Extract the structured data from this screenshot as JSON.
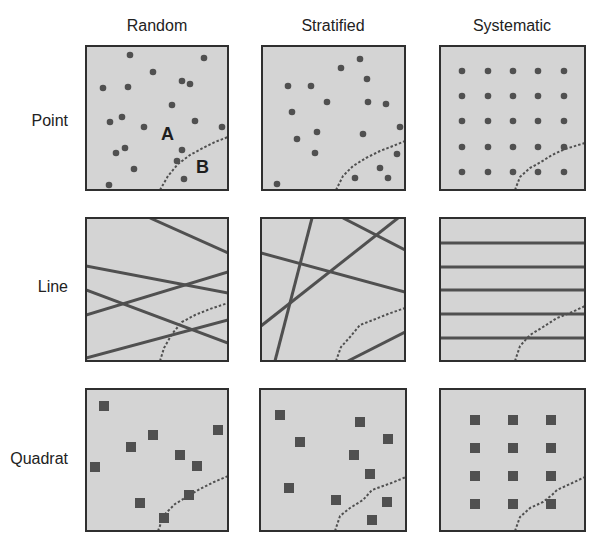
{
  "figure": {
    "columns": [
      "Random",
      "Stratified",
      "Systematic"
    ],
    "rows": [
      "Point",
      "Line",
      "Quadrat"
    ],
    "colors": {
      "panel_fill": "#d4d4d4",
      "panel_border": "#2f2f2f",
      "mark": "#505050",
      "boundary": "#505050",
      "text": "#222222"
    },
    "region_labels": [
      {
        "text": "A",
        "x": 161,
        "y": 140
      },
      {
        "text": "B",
        "x": 196,
        "y": 173
      }
    ]
  },
  "panels": [
    {
      "name": "panel-random-point",
      "row": "Point",
      "column": "Random",
      "box": [
        86,
        46,
        142,
        144
      ],
      "type": "points",
      "boundary": [
        [
          160,
          190
        ],
        [
          168,
          176
        ],
        [
          178,
          164
        ],
        [
          190,
          155
        ],
        [
          203,
          148
        ],
        [
          215,
          142
        ],
        [
          228,
          137
        ]
      ],
      "points": [
        [
          130,
          55
        ],
        [
          204,
          58
        ],
        [
          153,
          72
        ],
        [
          182,
          81
        ],
        [
          190,
          84
        ],
        [
          103,
          88
        ],
        [
          128,
          87
        ],
        [
          172,
          105
        ],
        [
          110,
          122
        ],
        [
          122,
          117
        ],
        [
          144,
          127
        ],
        [
          195,
          121
        ],
        [
          222,
          127
        ],
        [
          116,
          153
        ],
        [
          125,
          148
        ],
        [
          182,
          150
        ],
        [
          177,
          161
        ],
        [
          134,
          169
        ],
        [
          184,
          179
        ],
        [
          109,
          185
        ]
      ]
    },
    {
      "name": "panel-stratified-point",
      "row": "Point",
      "column": "Stratified",
      "box": [
        262,
        46,
        143,
        144
      ],
      "type": "points",
      "boundary": [
        [
          336,
          190
        ],
        [
          343,
          176
        ],
        [
          353,
          166
        ],
        [
          366,
          158
        ],
        [
          380,
          151
        ],
        [
          393,
          146
        ],
        [
          405,
          141
        ]
      ],
      "points": [
        [
          360,
          59
        ],
        [
          341,
          68
        ],
        [
          288,
          86
        ],
        [
          311,
          86
        ],
        [
          367,
          79
        ],
        [
          327,
          102
        ],
        [
          292,
          112
        ],
        [
          368,
          102
        ],
        [
          386,
          104
        ],
        [
          317,
          132
        ],
        [
          363,
          134
        ],
        [
          297,
          139
        ],
        [
          315,
          153
        ],
        [
          380,
          168
        ],
        [
          355,
          178
        ],
        [
          388,
          178
        ],
        [
          400,
          127
        ],
        [
          397,
          154
        ],
        [
          277,
          184
        ]
      ]
    },
    {
      "name": "panel-systematic-point",
      "row": "Point",
      "column": "Systematic",
      "box": [
        440,
        46,
        145,
        144
      ],
      "type": "points",
      "boundary": [
        [
          515,
          190
        ],
        [
          520,
          177
        ],
        [
          530,
          168
        ],
        [
          541,
          162
        ],
        [
          552,
          155
        ],
        [
          565,
          149
        ],
        [
          585,
          143
        ]
      ],
      "points": [
        [
          462,
          71
        ],
        [
          488,
          71
        ],
        [
          513,
          71
        ],
        [
          538,
          71
        ],
        [
          564,
          71
        ],
        [
          462,
          96
        ],
        [
          488,
          96
        ],
        [
          513,
          96
        ],
        [
          538,
          96
        ],
        [
          564,
          96
        ],
        [
          462,
          121
        ],
        [
          488,
          121
        ],
        [
          513,
          121
        ],
        [
          538,
          121
        ],
        [
          564,
          121
        ],
        [
          462,
          147
        ],
        [
          488,
          147
        ],
        [
          513,
          147
        ],
        [
          538,
          147
        ],
        [
          564,
          147
        ],
        [
          462,
          172
        ],
        [
          488,
          172
        ],
        [
          513,
          172
        ],
        [
          538,
          172
        ],
        [
          564,
          172
        ]
      ]
    },
    {
      "name": "panel-random-line",
      "row": "Line",
      "column": "Random",
      "box": [
        86,
        218,
        142,
        143
      ],
      "type": "lines",
      "boundary": [
        [
          160,
          361
        ],
        [
          164,
          348
        ],
        [
          172,
          334
        ],
        [
          182,
          322
        ],
        [
          195,
          315
        ],
        [
          210,
          309
        ],
        [
          228,
          303
        ]
      ],
      "lines": [
        [
          [
            150,
            218
          ],
          [
            228,
            253
          ]
        ],
        [
          [
            86,
            266
          ],
          [
            228,
            293
          ]
        ],
        [
          [
            86,
            315
          ],
          [
            228,
            272
          ]
        ],
        [
          [
            86,
            290
          ],
          [
            228,
            343
          ]
        ],
        [
          [
            86,
            358
          ],
          [
            228,
            320
          ]
        ]
      ]
    },
    {
      "name": "panel-stratified-line",
      "row": "Line",
      "column": "Stratified",
      "box": [
        261,
        218,
        144,
        143
      ],
      "type": "lines",
      "boundary": [
        [
          336,
          361
        ],
        [
          341,
          347
        ],
        [
          350,
          337
        ],
        [
          360,
          325
        ],
        [
          373,
          320
        ],
        [
          388,
          314
        ],
        [
          405,
          308
        ]
      ],
      "lines": [
        [
          [
            312,
            218
          ],
          [
            275,
            361
          ]
        ],
        [
          [
            343,
            218
          ],
          [
            405,
            250
          ]
        ],
        [
          [
            261,
            253
          ],
          [
            405,
            292
          ]
        ],
        [
          [
            261,
            326
          ],
          [
            398,
            218
          ]
        ],
        [
          [
            348,
            361
          ],
          [
            405,
            332
          ]
        ]
      ]
    },
    {
      "name": "panel-systematic-line",
      "row": "Line",
      "column": "Systematic",
      "box": [
        440,
        218,
        145,
        143
      ],
      "type": "lines",
      "boundary": [
        [
          515,
          361
        ],
        [
          520,
          346
        ],
        [
          530,
          335
        ],
        [
          543,
          327
        ],
        [
          557,
          318
        ],
        [
          570,
          313
        ],
        [
          585,
          306
        ]
      ],
      "lines": [
        [
          [
            440,
            243
          ],
          [
            585,
            243
          ]
        ],
        [
          [
            440,
            267
          ],
          [
            585,
            267
          ]
        ],
        [
          [
            440,
            290
          ],
          [
            585,
            290
          ]
        ],
        [
          [
            440,
            314
          ],
          [
            585,
            314
          ]
        ],
        [
          [
            440,
            338
          ],
          [
            585,
            338
          ]
        ]
      ]
    },
    {
      "name": "panel-random-quadrat",
      "row": "Quadrat",
      "column": "Random",
      "box": [
        86,
        389,
        142,
        142
      ],
      "type": "quadrats",
      "quadrat_size": 10,
      "boundary": [
        [
          158,
          531
        ],
        [
          164,
          515
        ],
        [
          175,
          504
        ],
        [
          190,
          495
        ],
        [
          200,
          489
        ],
        [
          214,
          482
        ],
        [
          228,
          476
        ]
      ],
      "quadrats": [
        [
          104,
          406
        ],
        [
          153,
          435
        ],
        [
          131,
          447
        ],
        [
          218,
          430
        ],
        [
          95,
          467
        ],
        [
          180,
          455
        ],
        [
          197,
          466
        ],
        [
          189,
          495
        ],
        [
          140,
          503
        ],
        [
          164,
          518
        ]
      ]
    },
    {
      "name": "panel-stratified-quadrat",
      "row": "Quadrat",
      "column": "Stratified",
      "box": [
        260,
        389,
        146,
        142
      ],
      "type": "quadrats",
      "quadrat_size": 10,
      "boundary": [
        [
          335,
          531
        ],
        [
          340,
          516
        ],
        [
          350,
          508
        ],
        [
          363,
          500
        ],
        [
          372,
          490
        ],
        [
          383,
          486
        ],
        [
          394,
          482
        ],
        [
          406,
          477
        ]
      ],
      "quadrats": [
        [
          280,
          415
        ],
        [
          360,
          422
        ],
        [
          300,
          442
        ],
        [
          388,
          439
        ],
        [
          354,
          455
        ],
        [
          370,
          474
        ],
        [
          289,
          488
        ],
        [
          336,
          500
        ],
        [
          387,
          502
        ],
        [
          372,
          520
        ]
      ]
    },
    {
      "name": "panel-systematic-quadrat",
      "row": "Quadrat",
      "column": "Systematic",
      "box": [
        440,
        389,
        145,
        142
      ],
      "type": "quadrats",
      "quadrat_size": 10,
      "boundary": [
        [
          515,
          531
        ],
        [
          520,
          517
        ],
        [
          530,
          508
        ],
        [
          543,
          502
        ],
        [
          552,
          495
        ],
        [
          557,
          490
        ],
        [
          570,
          484
        ],
        [
          585,
          477
        ]
      ],
      "quadrats": [
        [
          475,
          420
        ],
        [
          513,
          420
        ],
        [
          551,
          420
        ],
        [
          475,
          448
        ],
        [
          513,
          448
        ],
        [
          551,
          448
        ],
        [
          475,
          476
        ],
        [
          513,
          476
        ],
        [
          551,
          476
        ],
        [
          475,
          504
        ],
        [
          513,
          504
        ],
        [
          551,
          504
        ]
      ]
    }
  ],
  "label_positions": {
    "columns": [
      [
        157,
        31
      ],
      [
        333,
        31
      ],
      [
        512,
        31
      ]
    ],
    "rows": [
      [
        68,
        126
      ],
      [
        68,
        292
      ],
      [
        68,
        464
      ]
    ]
  }
}
